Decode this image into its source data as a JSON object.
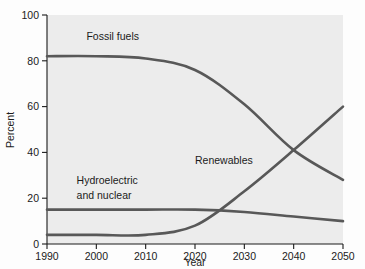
{
  "chart_data": {
    "type": "line",
    "title": "",
    "xlabel": "Year",
    "ylabel": "Percent",
    "xlim": [
      1990,
      2050
    ],
    "ylim": [
      0,
      100
    ],
    "grid": false,
    "legend_position": "inline-labels",
    "x": [
      1990,
      2000,
      2010,
      2020,
      2030,
      2040,
      2050
    ],
    "xticks": [
      "1990",
      "2000",
      "2010",
      "2020",
      "2030",
      "2040",
      "2050"
    ],
    "yticks": [
      "0",
      "20",
      "40",
      "60",
      "80",
      "100"
    ],
    "ytick_values": [
      0,
      20,
      40,
      60,
      80,
      100
    ],
    "line_color": "#585858",
    "line_width": 2.6,
    "series": [
      {
        "name": "Fossil fuels",
        "label": "Fossil fuels",
        "label_x": 1998,
        "label_y": 89,
        "values": [
          82,
          82,
          81,
          76,
          61,
          41,
          28
        ]
      },
      {
        "name": "Hydroelectric and nuclear",
        "label": "Hydroelectric and nuclear",
        "label_line1": "Hydroelectric",
        "label_line2": "and nuclear",
        "label_x": 1996,
        "label_y": 26,
        "values": [
          15,
          15,
          15,
          15,
          14,
          12,
          10
        ]
      },
      {
        "name": "Renewables",
        "label": "Renewables",
        "label_x": 2020,
        "label_y": 35,
        "values": [
          4,
          4,
          4,
          8,
          23,
          41,
          60
        ]
      }
    ],
    "annotations": [
      {
        "text": "crossover of Fossil fuels and Renewables",
        "x": 2040,
        "y": 41
      }
    ]
  }
}
